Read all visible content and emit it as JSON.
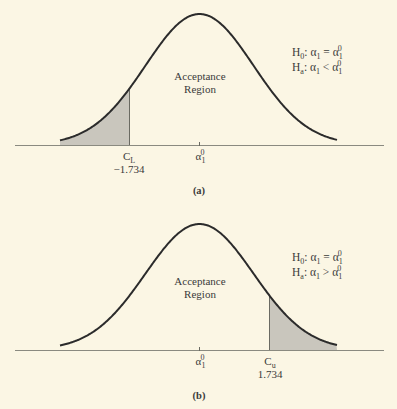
{
  "colors": {
    "background": "#fbf6e4",
    "curve": "#2b2b2b",
    "axis": "#8a8a80",
    "shade": "#c9c6bd"
  },
  "chart_data": [
    {
      "type": "area",
      "title": "(a)",
      "caption": "(a)",
      "description": "Normal distribution with left-tail rejection region (lower-tailed test)",
      "region_label_line1": "Acceptance",
      "region_label_line2": "Region",
      "hypotheses": {
        "h0": "H0: α1 = α1^0",
        "ha": "Ha: α1 < α1^0"
      },
      "h0": {
        "H": "H",
        "sub": "0",
        "lhs": ": α",
        "lhs_sub": "1",
        "op": " = α",
        "rhs_sub": "1",
        "rhs_sup": "0"
      },
      "ha": {
        "H": "H",
        "sub": "a",
        "lhs": ": α",
        "lhs_sub": "1",
        "op": " < α",
        "rhs_sub": "1",
        "rhs_sup": "0"
      },
      "center_tick": {
        "base": "α",
        "sub": "1",
        "sup": "0"
      },
      "critical": {
        "label": "C",
        "sub": "L",
        "value": "−1.734",
        "numeric": -1.734
      },
      "shaded_tail": "left"
    },
    {
      "type": "area",
      "title": "(b)",
      "caption": "(b)",
      "description": "Normal distribution with right-tail rejection region (upper-tailed test)",
      "region_label_line1": "Acceptance",
      "region_label_line2": "Region",
      "hypotheses": {
        "h0": "H0: α1 = α1^0",
        "ha": "Ha: α1 > α1^0"
      },
      "h0": {
        "H": "H",
        "sub": "0",
        "lhs": ": α",
        "lhs_sub": "1",
        "op": " = α",
        "rhs_sub": "1",
        "rhs_sup": "0"
      },
      "ha": {
        "H": "H",
        "sub": "a",
        "lhs": ": α",
        "lhs_sub": "1",
        "op": " > α",
        "rhs_sub": "1",
        "rhs_sup": "0"
      },
      "center_tick": {
        "base": "α",
        "sub": "1",
        "sup": "0"
      },
      "critical": {
        "label": "C",
        "sub": "u",
        "value": "1.734",
        "numeric": 1.734
      },
      "shaded_tail": "right"
    }
  ]
}
